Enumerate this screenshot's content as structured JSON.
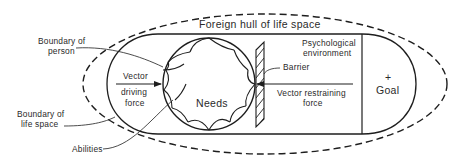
{
  "diagram": {
    "title": "Foreign hull of life space",
    "labels": {
      "boundary_person_1": "Boundary of",
      "boundary_person_2": "person",
      "boundary_life_1": "Boundary of",
      "boundary_life_2": "life space",
      "abilities": "Abilities",
      "vector_driving_1": "Vector",
      "vector_driving_2": "driving",
      "vector_driving_3": "force",
      "needs": "Needs",
      "barrier": "Barrier",
      "psych_env_1": "Psychological",
      "psych_env_2": "environment",
      "vector_restraining_1": "Vector restraining",
      "vector_restraining_2": "force",
      "goal_sign": "+",
      "goal": "Goal"
    },
    "colors": {
      "line": "#1e1e1e",
      "text": "#2a2a2a",
      "background": "#ffffff"
    }
  }
}
